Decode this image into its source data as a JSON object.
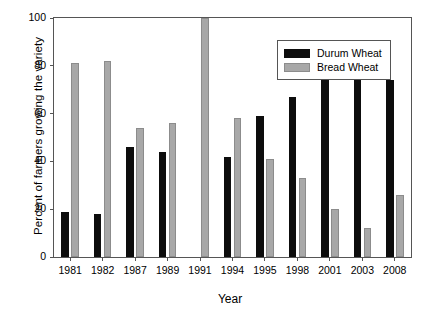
{
  "chart_data": {
    "type": "bar",
    "title": "",
    "xlabel": "Year",
    "ylabel": "Percent of farmers growing the variety",
    "categories": [
      "1981",
      "1982",
      "1987",
      "1989",
      "1991",
      "1994",
      "1995",
      "1998",
      "2001",
      "2003",
      "2008"
    ],
    "series": [
      {
        "name": "Durum Wheat",
        "color": "#0d0d0d",
        "values": [
          19,
          18,
          46,
          44,
          0,
          42,
          59,
          67,
          80,
          87,
          74
        ]
      },
      {
        "name": "Bread Wheat",
        "color": "#a8a8a8",
        "values": [
          81,
          82,
          54,
          56,
          100,
          58,
          41,
          33,
          20,
          12,
          26
        ]
      }
    ],
    "ylim": [
      0,
      100
    ],
    "yticks": [
      0,
      20,
      40,
      60,
      80,
      100
    ],
    "ytick_labels": [
      "0",
      "20",
      "40",
      "60",
      "80",
      "100"
    ],
    "grid": false,
    "legend_position": "top-right"
  },
  "legend": {
    "entries": [
      {
        "label": "Durum Wheat",
        "swatch": "durum"
      },
      {
        "label": "Bread Wheat",
        "swatch": "bread"
      }
    ]
  }
}
